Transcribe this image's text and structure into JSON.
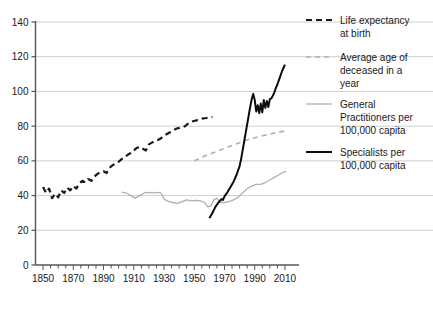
{
  "chart_data": {
    "type": "line",
    "title": "",
    "xlabel": "",
    "ylabel": "",
    "xlim": [
      1845,
      2014
    ],
    "ylim": [
      0,
      140
    ],
    "grid": true,
    "legend_position": "right",
    "x_ticks": [
      1850,
      1870,
      1890,
      1910,
      1930,
      1950,
      1970,
      1990,
      2010
    ],
    "x_tick_labels": [
      "1850",
      "1870",
      "1890",
      "1910",
      "1930",
      "1950",
      "1970",
      "1990",
      "2010"
    ],
    "x_minor_tick_step": 5,
    "y_ticks": [
      0,
      20,
      40,
      60,
      80,
      100,
      120,
      140
    ],
    "y_tick_labels": [
      "0",
      "20",
      "40",
      "60",
      "80",
      "100",
      "120",
      "140"
    ],
    "series": [
      {
        "name": "Life expectancy at birth",
        "style": "dashed",
        "color": "#1a1a1a",
        "width": 2.2,
        "points": [
          [
            1850,
            45.0
          ],
          [
            1852,
            41.5
          ],
          [
            1854,
            44.0
          ],
          [
            1856,
            38.5
          ],
          [
            1858,
            41.0
          ],
          [
            1860,
            39.0
          ],
          [
            1862,
            43.0
          ],
          [
            1864,
            41.5
          ],
          [
            1866,
            44.5
          ],
          [
            1868,
            43.0
          ],
          [
            1870,
            45.5
          ],
          [
            1872,
            44.0
          ],
          [
            1874,
            47.0
          ],
          [
            1876,
            48.5
          ],
          [
            1878,
            47.5
          ],
          [
            1880,
            49.5
          ],
          [
            1882,
            48.5
          ],
          [
            1884,
            51.0
          ],
          [
            1886,
            52.5
          ],
          [
            1888,
            53.5
          ],
          [
            1890,
            54.0
          ],
          [
            1892,
            53.0
          ],
          [
            1894,
            56.0
          ],
          [
            1896,
            57.5
          ],
          [
            1898,
            58.5
          ],
          [
            1900,
            59.5
          ],
          [
            1902,
            61.0
          ],
          [
            1904,
            62.0
          ],
          [
            1906,
            63.5
          ],
          [
            1908,
            64.5
          ],
          [
            1910,
            66.0
          ],
          [
            1912,
            67.5
          ],
          [
            1914,
            68.0
          ],
          [
            1916,
            67.0
          ],
          [
            1918,
            66.0
          ],
          [
            1920,
            69.5
          ],
          [
            1922,
            70.5
          ],
          [
            1924,
            71.5
          ],
          [
            1926,
            72.0
          ],
          [
            1928,
            73.0
          ],
          [
            1930,
            74.5
          ],
          [
            1932,
            75.5
          ],
          [
            1934,
            76.5
          ],
          [
            1936,
            77.5
          ],
          [
            1938,
            78.5
          ],
          [
            1940,
            79.0
          ],
          [
            1942,
            79.5
          ],
          [
            1944,
            80.0
          ],
          [
            1946,
            81.5
          ],
          [
            1948,
            82.5
          ],
          [
            1950,
            83.0
          ],
          [
            1952,
            83.5
          ],
          [
            1954,
            84.0
          ],
          [
            1956,
            84.5
          ],
          [
            1958,
            84.7
          ],
          [
            1960,
            85.0
          ],
          [
            1962,
            85.2
          ]
        ]
      },
      {
        "name": "Average age of deceased in a year",
        "style": "dashed",
        "color": "#b0b0b0",
        "width": 1.6,
        "points": [
          [
            1950,
            60.0
          ],
          [
            1953,
            61.0
          ],
          [
            1956,
            62.5
          ],
          [
            1959,
            63.5
          ],
          [
            1962,
            64.5
          ],
          [
            1965,
            65.5
          ],
          [
            1968,
            66.5
          ],
          [
            1971,
            67.5
          ],
          [
            1974,
            68.5
          ],
          [
            1977,
            69.5
          ],
          [
            1980,
            70.5
          ],
          [
            1983,
            71.5
          ],
          [
            1986,
            72.3
          ],
          [
            1989,
            73.0
          ],
          [
            1992,
            73.8
          ],
          [
            1995,
            74.5
          ],
          [
            1998,
            75.0
          ],
          [
            2001,
            75.6
          ],
          [
            2004,
            76.2
          ],
          [
            2007,
            76.7
          ],
          [
            2010,
            77.2
          ]
        ]
      },
      {
        "name": "General Practitioners per 100,000 capita",
        "style": "solid",
        "color": "#b0b0b0",
        "width": 1.3,
        "points": [
          [
            1902,
            42.0
          ],
          [
            1905,
            41.5
          ],
          [
            1908,
            40.0
          ],
          [
            1911,
            38.5
          ],
          [
            1914,
            40.0
          ],
          [
            1917,
            41.5
          ],
          [
            1920,
            41.8
          ],
          [
            1923,
            41.5
          ],
          [
            1926,
            41.8
          ],
          [
            1928,
            41.5
          ],
          [
            1930,
            38.0
          ],
          [
            1933,
            36.5
          ],
          [
            1936,
            36.0
          ],
          [
            1939,
            35.5
          ],
          [
            1942,
            36.5
          ],
          [
            1945,
            37.5
          ],
          [
            1948,
            37.0
          ],
          [
            1951,
            37.2
          ],
          [
            1954,
            37.0
          ],
          [
            1957,
            36.0
          ],
          [
            1959,
            33.5
          ],
          [
            1961,
            34.0
          ],
          [
            1963,
            37.5
          ],
          [
            1965,
            38.5
          ],
          [
            1967,
            36.0
          ],
          [
            1970,
            36.0
          ],
          [
            1973,
            36.5
          ],
          [
            1976,
            37.5
          ],
          [
            1979,
            39.0
          ],
          [
            1982,
            41.5
          ],
          [
            1985,
            44.0
          ],
          [
            1988,
            45.5
          ],
          [
            1991,
            46.5
          ],
          [
            1994,
            46.5
          ],
          [
            1997,
            47.5
          ],
          [
            2000,
            49.0
          ],
          [
            2003,
            50.5
          ],
          [
            2006,
            52.0
          ],
          [
            2009,
            53.5
          ],
          [
            2011,
            53.8
          ]
        ]
      },
      {
        "name": "Specialists per 100,000 capita",
        "style": "solid",
        "color": "#0d0d0d",
        "width": 2.0,
        "points": [
          [
            1960,
            27.0
          ],
          [
            1962,
            30.0
          ],
          [
            1964,
            33.5
          ],
          [
            1966,
            36.0
          ],
          [
            1968,
            38.0
          ],
          [
            1969,
            37.5
          ],
          [
            1970,
            39.5
          ],
          [
            1972,
            42.0
          ],
          [
            1974,
            45.0
          ],
          [
            1976,
            48.0
          ],
          [
            1978,
            52.0
          ],
          [
            1980,
            57.0
          ],
          [
            1981,
            61.0
          ],
          [
            1982,
            66.0
          ],
          [
            1983,
            71.0
          ],
          [
            1984,
            76.0
          ],
          [
            1985,
            81.0
          ],
          [
            1986,
            86.0
          ],
          [
            1987,
            91.0
          ],
          [
            1988,
            95.5
          ],
          [
            1989,
            98.5
          ],
          [
            1990,
            95.0
          ],
          [
            1991,
            88.5
          ],
          [
            1992,
            92.0
          ],
          [
            1993,
            87.5
          ],
          [
            1994,
            93.0
          ],
          [
            1995,
            88.0
          ],
          [
            1996,
            95.0
          ],
          [
            1997,
            90.5
          ],
          [
            1998,
            94.5
          ],
          [
            1999,
            91.0
          ],
          [
            2000,
            95.5
          ],
          [
            2001,
            96.0
          ],
          [
            2002,
            97.5
          ],
          [
            2003,
            99.5
          ],
          [
            2004,
            102.0
          ],
          [
            2005,
            104.0
          ],
          [
            2006,
            106.5
          ],
          [
            2007,
            109.0
          ],
          [
            2008,
            111.5
          ],
          [
            2009,
            113.5
          ],
          [
            2010,
            115.5
          ]
        ]
      }
    ]
  },
  "legend": {
    "items": [
      {
        "label_line_1": "Life expectancy",
        "label_line_2": "at birth",
        "label_line_3": ""
      },
      {
        "label_line_1": "Average age of",
        "label_line_2": "deceased in a",
        "label_line_3": "year"
      },
      {
        "label_line_1": "General",
        "label_line_2": "Practitioners per",
        "label_line_3": "100,000 capita"
      },
      {
        "label_line_1": "Specialists per",
        "label_line_2": "100,000 capita",
        "label_line_3": ""
      }
    ]
  },
  "colors": {
    "dark": "#1a1a1a",
    "gray": "#b0b0b0",
    "grid": "#cfcfcf",
    "axis": "#555555",
    "background": "#ffffff"
  }
}
